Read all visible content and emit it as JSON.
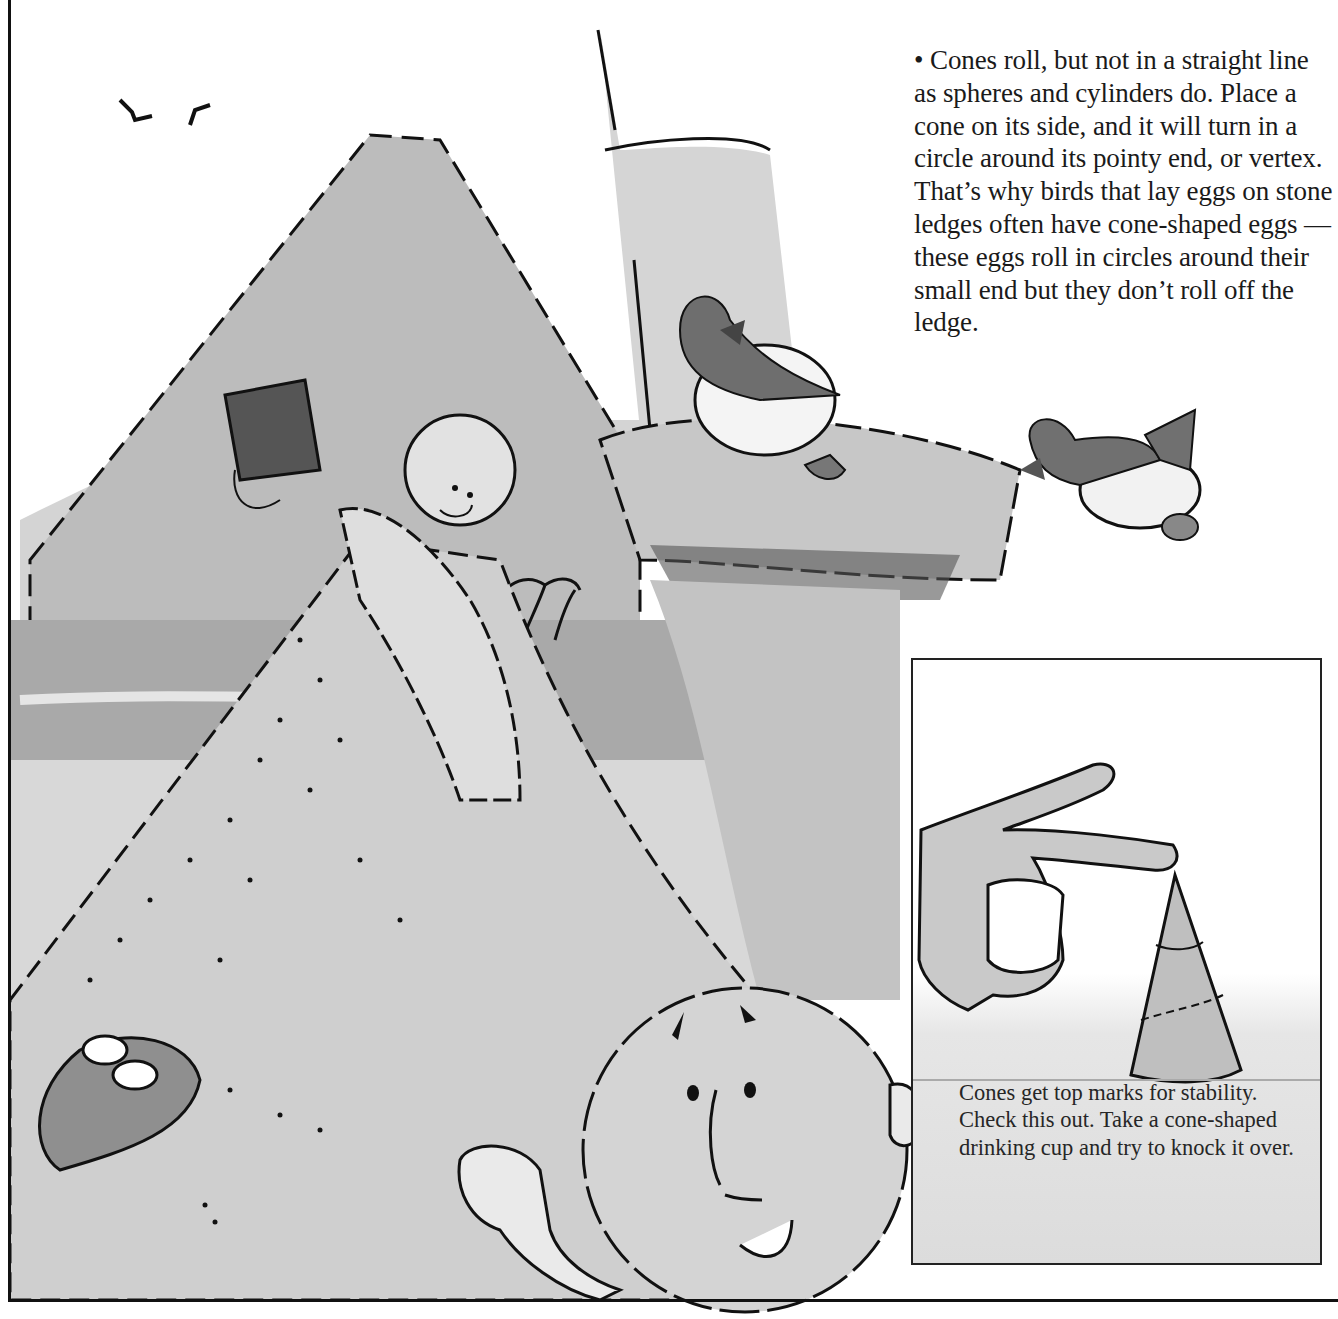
{
  "page": {
    "main_paragraph": "• Cones roll, but not in a straight line as spheres and cylinders do. Place a cone on its side, and it will turn in a circle around its pointy end, or vertex. That’s why birds that lay eggs on stone ledges often have cone-shaped eggs — these eggs roll in circles around their small end but they don’t roll off the ledge.",
    "inset_caption": "Cones get top marks for stability. Check this out. Take a cone-shaped drinking cup and try to knock it over."
  },
  "illustration": {
    "style": "grayscale watercolor with ink line",
    "elements": [
      "birds-flying",
      "sand-cone-mountain",
      "boy-pouring-bucket",
      "stone-tower-ledge",
      "sea-bird-on-ledge",
      "sea-bird-with-egg",
      "palm-trees",
      "sea",
      "sphere-character",
      "buried-child",
      "hand-flicking-cone",
      "paper-cone"
    ]
  },
  "colors": {
    "ink": "#111111",
    "wash_light": "#d9d9d9",
    "wash_mid": "#bdbdbd",
    "wash_dark": "#8a8a8a",
    "bird_dark": "#6e6e6e",
    "paper": "#ffffff"
  }
}
